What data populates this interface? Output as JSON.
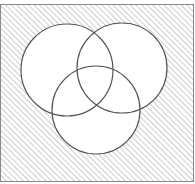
{
  "diagram": {
    "type": "venn",
    "sets": [
      {
        "id": "A",
        "label": ""
      },
      {
        "id": "B",
        "label": ""
      },
      {
        "id": "C",
        "label": ""
      }
    ],
    "shaded_region": "complement of (A ∪ B ∪ C)",
    "colors": {
      "outline": "#555555",
      "hatch": "#b8b8b8",
      "fill": "#ffffff",
      "border": "#888888"
    }
  }
}
